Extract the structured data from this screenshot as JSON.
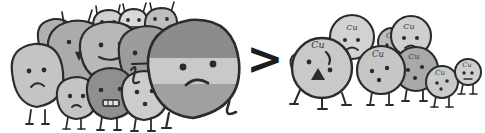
{
  "image": {
    "title": "Hand-drawn grayscale cartoon comparison of two clusters of blob creatures",
    "background_color": "#ffffff",
    "width": 485,
    "height": 133
  },
  "comparison": {
    "symbol": ">",
    "symbol_color": "#1c1c1c",
    "meaning": "left group is greater than right group"
  },
  "palette": {
    "outline": "#2b2b2b",
    "light_gray": "#d9d9d9",
    "mid_light_gray": "#c4c4c4",
    "mid_gray": "#ababab",
    "dark_gray": "#8f8f8f",
    "darker_gray": "#6f6f6f",
    "band_dark": "#8c8c8c",
    "band_light": "#c9c9c9",
    "band_mid": "#a0a0a0",
    "face_stroke": "#2b2b2b",
    "label_color": "#3a3a3a"
  },
  "left_group": {
    "name": "large-rock-blob-cluster",
    "count": 12,
    "description": "Crowded cluster of angular rock-like blob creatures with stick legs, simple dot eyes and frowning mouths; a very large banded blob stands in front at the right of the cluster",
    "members": [
      {
        "id": "rock-1",
        "shape": "angular",
        "fill": "#c4c4c4",
        "cx": 36,
        "cy": 74,
        "rx": 26,
        "ry": 31,
        "rot": -6,
        "face": "frown",
        "eyes": 2,
        "legs": 2,
        "antennae": 0,
        "label": ""
      },
      {
        "id": "rock-2",
        "shape": "angular",
        "fill": "#ababab",
        "cx": 78,
        "cy": 56,
        "rx": 31,
        "ry": 36,
        "rot": 5,
        "face": "open-triangle",
        "eyes": 2,
        "legs": 2,
        "antennae": 2,
        "label": ""
      },
      {
        "id": "rock-3",
        "shape": "angular",
        "fill": "#c4c4c4",
        "cx": 76,
        "cy": 98,
        "rx": 19,
        "ry": 22,
        "rot": -3,
        "face": "frown",
        "eyes": 2,
        "legs": 2,
        "antennae": 0,
        "label": ""
      },
      {
        "id": "rock-4",
        "shape": "angular",
        "fill": "#8f8f8f",
        "cx": 110,
        "cy": 93,
        "rx": 22,
        "ry": 25,
        "rot": 4,
        "face": "grimace",
        "eyes": 2,
        "legs": 2,
        "antennae": 0,
        "label": ""
      },
      {
        "id": "rock-5",
        "shape": "angular",
        "fill": "#b8b8b8",
        "cx": 110,
        "cy": 50,
        "rx": 30,
        "ry": 30,
        "rot": -4,
        "face": "smile",
        "eyes": 2,
        "legs": 0,
        "antennae": 0,
        "label": ""
      },
      {
        "id": "rock-6",
        "shape": "rounded",
        "fill": "#d0d0d0",
        "cx": 108,
        "cy": 22,
        "rx": 17,
        "ry": 14,
        "rot": 0,
        "face": "dots",
        "eyes": 2,
        "legs": 0,
        "antennae": 2,
        "label": ""
      },
      {
        "id": "rock-7",
        "shape": "rounded",
        "fill": "#d9d9d9",
        "cx": 133,
        "cy": 20,
        "rx": 16,
        "ry": 13,
        "rot": 0,
        "face": "dots",
        "eyes": 2,
        "legs": 0,
        "antennae": 2,
        "label": ""
      },
      {
        "id": "rock-8",
        "shape": "rounded",
        "fill": "#bdbdbd",
        "cx": 160,
        "cy": 18,
        "rx": 17,
        "ry": 14,
        "rot": 0,
        "face": "dots",
        "eyes": 2,
        "legs": 0,
        "antennae": 2,
        "label": ""
      },
      {
        "id": "rock-9",
        "shape": "angular",
        "fill": "#cccccc",
        "cx": 143,
        "cy": 95,
        "rx": 21,
        "ry": 24,
        "rot": 6,
        "face": "dots",
        "eyes": 3,
        "legs": 2,
        "antennae": 0,
        "label": ""
      },
      {
        "id": "rock-10",
        "shape": "angular",
        "fill": "#9c9c9c",
        "cx": 145,
        "cy": 60,
        "rx": 27,
        "ry": 30,
        "rot": -5,
        "face": "flat",
        "eyes": 2,
        "legs": 0,
        "antennae": 0,
        "label": ""
      },
      {
        "id": "rock-11",
        "shape": "angular",
        "fill": "#b0b0b0",
        "cx": 55,
        "cy": 36,
        "rx": 20,
        "ry": 20,
        "rot": -8,
        "face": "none",
        "eyes": 0,
        "legs": 0,
        "antennae": 0,
        "label": ""
      },
      {
        "id": "big-blob",
        "shape": "banded",
        "fill": "#8c8c8c",
        "cx": 193,
        "cy": 70,
        "rx": 47,
        "ry": 52,
        "rot": 0,
        "face": "frown-big",
        "eyes": 2,
        "legs": 2,
        "antennae": 0,
        "label": ""
      }
    ],
    "hero": {
      "id": "big-blob",
      "description": "Largest blob, rounded square body with three horizontal tone bands (dark top, light middle, mid bottom), frowning face, one raised arm on the right and a bent leg",
      "bands": [
        "#8c8c8c",
        "#c9c9c9",
        "#a0a0a0"
      ],
      "expression": "frowning"
    }
  },
  "right_group": {
    "name": "cu-sphere-cluster",
    "count": 8,
    "label_text": "Cu",
    "description": "Smaller cluster of round sphere creatures each marked with the italic label Cu; the frontmost one has an angry face with a triangular open mouth; a tiny one stands apart at the far right",
    "members": [
      {
        "id": "cu-1",
        "shape": "circle",
        "fill": "#c9c9c9",
        "cx": 322,
        "cy": 68,
        "r": 30,
        "face": "angry-triangle",
        "eyes": 2,
        "legs": 3,
        "label": "Cu",
        "label_x": 318,
        "label_y": 45
      },
      {
        "id": "cu-2",
        "shape": "circle",
        "fill": "#d2d2d2",
        "cx": 352,
        "cy": 37,
        "r": 22,
        "face": "frown",
        "eyes": 2,
        "legs": 0,
        "label": "Cu",
        "label_x": 352,
        "label_y": 28
      },
      {
        "id": "cu-3",
        "shape": "circle",
        "fill": "#c6c6c6",
        "cx": 381,
        "cy": 70,
        "r": 24,
        "face": "dots",
        "eyes": 3,
        "legs": 2,
        "label": "Cu",
        "label_x": 378,
        "label_y": 54
      },
      {
        "id": "cu-4",
        "shape": "circle",
        "fill": "#bcbcbc",
        "cx": 392,
        "cy": 42,
        "r": 14,
        "face": "dots",
        "eyes": 2,
        "legs": 0,
        "label": "Cu",
        "label_x": 391,
        "label_y": 36
      },
      {
        "id": "cu-5",
        "shape": "circle",
        "fill": "#cfcfcf",
        "cx": 411,
        "cy": 36,
        "r": 20,
        "face": "frown",
        "eyes": 2,
        "legs": 0,
        "label": "Cu",
        "label_x": 409,
        "label_y": 27
      },
      {
        "id": "cu-6",
        "shape": "circle",
        "fill": "#a9a9a9",
        "cx": 416,
        "cy": 69,
        "r": 22,
        "face": "dots",
        "eyes": 3,
        "legs": 2,
        "label": "Cu",
        "label_x": 414,
        "label_y": 57
      },
      {
        "id": "cu-7",
        "shape": "circle",
        "fill": "#cacaca",
        "cx": 442,
        "cy": 82,
        "r": 16,
        "face": "dots",
        "eyes": 3,
        "legs": 2,
        "label": "Cu",
        "label_x": 440,
        "label_y": 73
      },
      {
        "id": "cu-8",
        "shape": "circle",
        "fill": "#d0d0d0",
        "cx": 468,
        "cy": 72,
        "r": 13,
        "face": "dots",
        "eyes": 2,
        "legs": 2,
        "label": "Cu",
        "label_x": 467,
        "label_y": 65
      }
    ]
  },
  "accessibility": {
    "alt_text": "A large crowd of gray rock-like cartoon blobs on the left, a bold greater-than sign in the middle, and a smaller crowd of round cartoon spheres labeled Cu on the right."
  }
}
